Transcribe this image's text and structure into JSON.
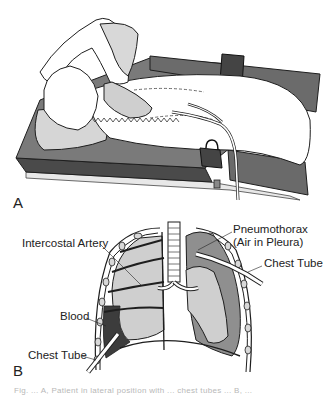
{
  "figure": {
    "panels": [
      {
        "id": "A",
        "label": "A",
        "description": "Patient lying on side on table with chest tubes inserted, secured by strap"
      },
      {
        "id": "B",
        "label": "B",
        "description": "Lungs in chest cavity showing hemothorax and pneumothorax with chest tubes"
      }
    ],
    "labels": {
      "intercostal_artery": "Intercostal Artery",
      "pneumothorax_line1": "Pneumothorax",
      "pneumothorax_line2": "(Air in Pleura)",
      "chest_tube_right": "Chest Tube",
      "blood": "Blood",
      "chest_tube_left": "Chest Tube"
    },
    "caption": "Fig. ... A, Patient in lateral position with ... chest tubes ... B, ..."
  },
  "colors": {
    "table_dark": "#5e5e5e",
    "table_mid": "#7a7a7a",
    "sheet": "#ffffff",
    "outline": "#1e1e1e",
    "lung_fill": "#cfcfcf",
    "pleura_air": "#8f8f8f",
    "blood": "#3c3c3c",
    "caption_gray": "#b8b8b8"
  }
}
